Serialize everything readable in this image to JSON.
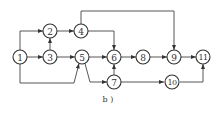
{
  "diagram": {
    "type": "network-diagram",
    "caption": "b )",
    "nodes": [
      {
        "id": "1",
        "label": "1"
      },
      {
        "id": "2",
        "label": "2"
      },
      {
        "id": "3",
        "label": "3"
      },
      {
        "id": "4",
        "label": "4"
      },
      {
        "id": "5",
        "label": "5"
      },
      {
        "id": "6",
        "label": "6"
      },
      {
        "id": "7",
        "label": "7"
      },
      {
        "id": "8",
        "label": "8"
      },
      {
        "id": "9",
        "label": "9"
      },
      {
        "id": "10",
        "label": "10"
      },
      {
        "id": "11",
        "label": "11"
      }
    ],
    "edges": [
      {
        "from": "1",
        "to": "2"
      },
      {
        "from": "1",
        "to": "3"
      },
      {
        "from": "1",
        "to": "5"
      },
      {
        "from": "3",
        "to": "2"
      },
      {
        "from": "2",
        "to": "4"
      },
      {
        "from": "3",
        "to": "5"
      },
      {
        "from": "4",
        "to": "9"
      },
      {
        "from": "4",
        "to": "6"
      },
      {
        "from": "5",
        "to": "6"
      },
      {
        "from": "5",
        "to": "7"
      },
      {
        "from": "7",
        "to": "6"
      },
      {
        "from": "6",
        "to": "8"
      },
      {
        "from": "8",
        "to": "9"
      },
      {
        "from": "9",
        "to": "11"
      },
      {
        "from": "7",
        "to": "10"
      },
      {
        "from": "10",
        "to": "11"
      }
    ],
    "colors": {
      "stroke": "#333333",
      "background": "#ffffff"
    }
  }
}
